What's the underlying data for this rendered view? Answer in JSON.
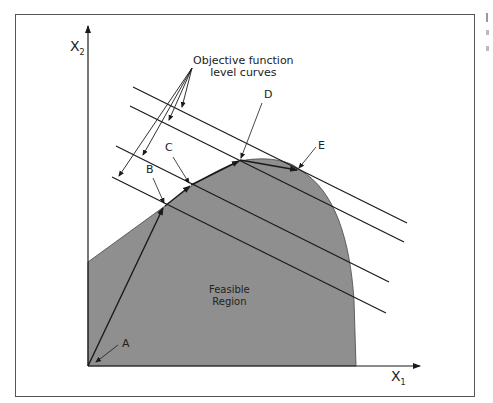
{
  "figure": {
    "axes": {
      "x_label": "X",
      "x_sub": "1",
      "y_label": "X",
      "y_sub": "2"
    },
    "callout": {
      "line1": "Objective function",
      "line2": "level curves"
    },
    "points": [
      {
        "id": "A",
        "label": "A"
      },
      {
        "id": "B",
        "label": "B"
      },
      {
        "id": "C",
        "label": "C"
      },
      {
        "id": "D",
        "label": "D"
      },
      {
        "id": "E",
        "label": "E"
      }
    ],
    "region": {
      "line1": "Feasible",
      "line2": "Region"
    },
    "colors": {
      "region_fill": "#8f8f8f",
      "line": "#1a1a1a",
      "frame": "#555555"
    }
  }
}
